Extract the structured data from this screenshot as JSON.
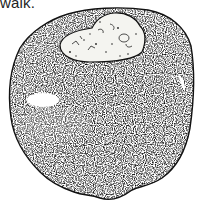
{
  "page": {
    "caption_text": "walk.",
    "figure": {
      "subject": "stippled drawing of a rounded stone object with a light textured patch at the top",
      "icon": "stone-illustration",
      "colors": {
        "ink": "#111111",
        "paper": "#ffffff",
        "patch": "#f4f4f0"
      }
    }
  }
}
